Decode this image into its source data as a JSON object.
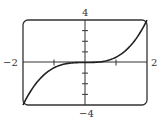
{
  "chart_data": {
    "type": "line",
    "title": "",
    "xlabel": "",
    "ylabel": "",
    "xlim": [
      -2,
      2
    ],
    "ylim": [
      -4,
      4
    ],
    "grid": false,
    "x_tick_labels": {
      "left": "−2",
      "right": "2"
    },
    "y_tick_labels": {
      "top": "4",
      "bottom": "−4"
    },
    "x_ticks": [
      -1,
      1
    ],
    "y_ticks": [
      -3,
      -2,
      -1,
      1,
      2,
      3
    ],
    "series": [
      {
        "name": "y = x^3/2",
        "x": [
          -2,
          -1.5,
          -1,
          -0.5,
          0,
          0.5,
          1,
          1.5,
          2
        ],
        "values": [
          -4,
          -1.6875,
          -0.5,
          -0.0625,
          0,
          0.0625,
          0.5,
          1.6875,
          4
        ]
      }
    ]
  }
}
